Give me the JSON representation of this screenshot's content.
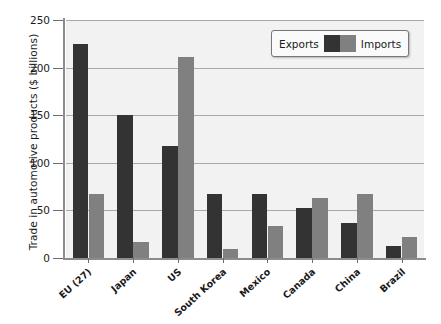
{
  "chart_data": {
    "type": "bar",
    "title": "",
    "xlabel": "",
    "ylabel": "Trade in automotive products ($ billions)",
    "ylim": [
      0,
      250
    ],
    "yticks": [
      0,
      50,
      100,
      150,
      200,
      250
    ],
    "grid": true,
    "legend_position": "top-right",
    "categories": [
      "EU (27)",
      "Japan",
      "US",
      "South Korea",
      "Mexico",
      "Canada",
      "China",
      "Brazil"
    ],
    "series": [
      {
        "name": "Exports",
        "color": "#333333",
        "values": [
          225,
          150,
          118,
          67,
          67,
          53,
          37,
          13
        ]
      },
      {
        "name": "Imports",
        "color": "#808080",
        "values": [
          67,
          17,
          211,
          9,
          34,
          63,
          67,
          22
        ]
      }
    ]
  },
  "legend": {
    "exports_label": "Exports",
    "imports_label": "Imports"
  }
}
